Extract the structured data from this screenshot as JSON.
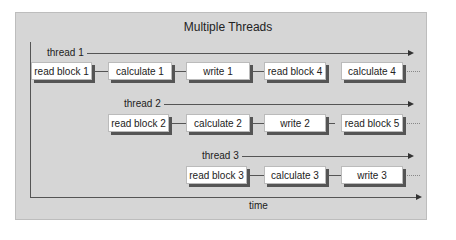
{
  "title": "Multiple Threads",
  "axis_label": "time",
  "threads": [
    {
      "label": "thread 1",
      "blocks": [
        "read block 1",
        "calculate 1",
        "write 1",
        "read block 4",
        "calculate 4"
      ]
    },
    {
      "label": "thread 2",
      "blocks": [
        "read block 2",
        "calculate 2",
        "write 2",
        "read block 5"
      ]
    },
    {
      "label": "thread 3",
      "blocks": [
        "read block 3",
        "calculate 3",
        "write 3"
      ]
    }
  ]
}
